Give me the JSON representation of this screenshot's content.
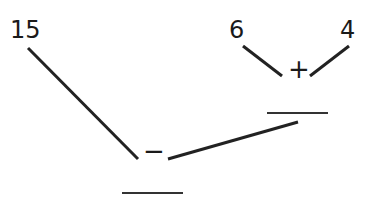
{
  "diagram": {
    "type": "arithmetic-tree",
    "numbers": {
      "left_top": "15",
      "right_left": "6",
      "right_right": "4"
    },
    "operators": {
      "upper": "+",
      "lower": "−"
    },
    "blanks": {
      "upper_result": "",
      "final_result": ""
    }
  }
}
